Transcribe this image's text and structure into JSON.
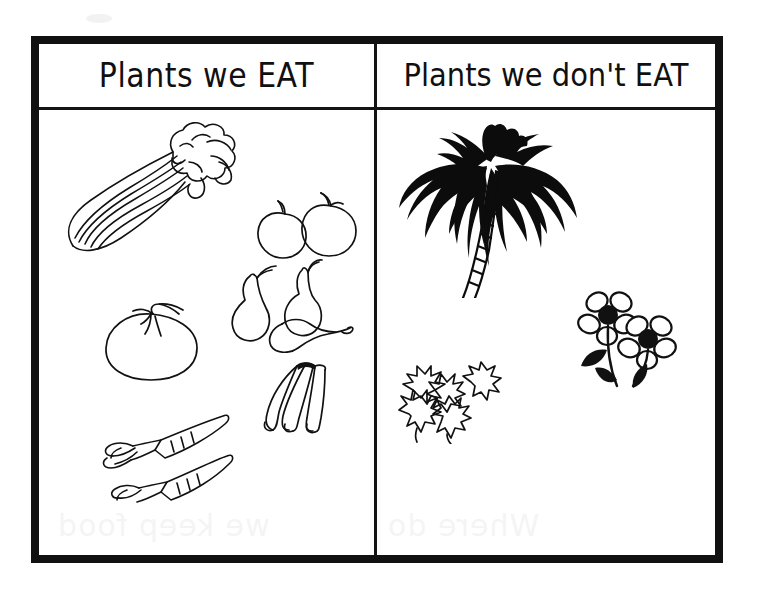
{
  "poster": {
    "title_left": "Plants we EAT",
    "title_right": "Plants we don't EAT",
    "ink_color": "#101010",
    "paper_color": "#ffffff",
    "frame_color": "#111111"
  },
  "columns": [
    {
      "id": "eat",
      "header": "Plants we EAT",
      "items": [
        {
          "name": "celery",
          "label": "celery stalk bunch"
        },
        {
          "name": "apples",
          "label": "two apples"
        },
        {
          "name": "pears",
          "label": "three pears"
        },
        {
          "name": "tomato",
          "label": "tomato"
        },
        {
          "name": "bananas",
          "label": "bunch of bananas"
        },
        {
          "name": "carrots",
          "label": "two carrots"
        }
      ]
    },
    {
      "id": "dont-eat",
      "header": "Plants we don't EAT",
      "items": [
        {
          "name": "palm-tree",
          "label": "palm tree"
        },
        {
          "name": "holly",
          "label": "holly leaves"
        },
        {
          "name": "flowers",
          "label": "two daisy flowers"
        }
      ]
    }
  ],
  "bleed_through": {
    "left": "we keep food",
    "right": "Where do"
  }
}
